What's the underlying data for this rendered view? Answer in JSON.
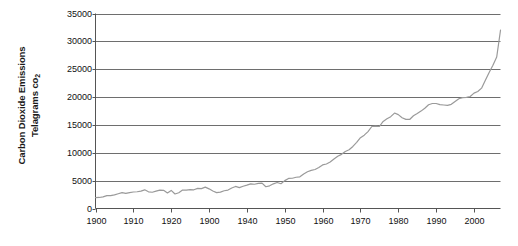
{
  "chart_data": {
    "type": "line",
    "title": "",
    "xlabel": "",
    "ylabel": "Carbon Dioxide Emissions Telagrams co2",
    "ylabel_line1": "Carbon Dioxide Emissions",
    "ylabel_line2_prefix": "Telagrams co",
    "ylabel_line2_subscript": "2",
    "xlim": [
      1900,
      2007
    ],
    "ylim": [
      0,
      35000
    ],
    "y_ticks": [
      0,
      5000,
      10000,
      15000,
      20000,
      25000,
      30000,
      35000
    ],
    "y_tick_labels": [
      "0",
      "5000",
      "10000",
      "15000",
      "20000",
      "25000",
      "30000",
      "35000"
    ],
    "x_ticks": [
      1900,
      1910,
      1920,
      1930,
      1940,
      1950,
      1960,
      1970,
      1980,
      1990,
      2000
    ],
    "x_tick_labels": [
      "1900",
      "1910",
      "1920",
      "1900",
      "1940",
      "1950",
      "1960",
      "1970",
      "1980",
      "1990",
      "2000"
    ],
    "grid": "horizontal",
    "legend": "none",
    "series_color": "#9a9a9a",
    "axis_color": "#555555",
    "grid_color": "#6e6e6e",
    "background": "#ffffff",
    "series": [
      {
        "name": "Carbon Dioxide Emissions",
        "x": [
          1900,
          1901,
          1902,
          1903,
          1904,
          1905,
          1906,
          1907,
          1908,
          1909,
          1910,
          1911,
          1912,
          1913,
          1914,
          1915,
          1916,
          1917,
          1918,
          1919,
          1920,
          1921,
          1922,
          1923,
          1924,
          1925,
          1926,
          1927,
          1928,
          1929,
          1930,
          1931,
          1932,
          1933,
          1934,
          1935,
          1936,
          1937,
          1938,
          1939,
          1940,
          1941,
          1942,
          1943,
          1944,
          1945,
          1946,
          1947,
          1948,
          1949,
          1950,
          1951,
          1952,
          1953,
          1954,
          1955,
          1956,
          1957,
          1958,
          1959,
          1960,
          1961,
          1962,
          1963,
          1964,
          1965,
          1966,
          1967,
          1968,
          1969,
          1970,
          1971,
          1972,
          1973,
          1974,
          1975,
          1976,
          1977,
          1978,
          1979,
          1980,
          1981,
          1982,
          1983,
          1984,
          1985,
          1986,
          1987,
          1988,
          1989,
          1990,
          1991,
          1992,
          1993,
          1994,
          1995,
          1996,
          1997,
          1998,
          1999,
          2000,
          2001,
          2002,
          2003,
          2004,
          2005,
          2006,
          2007
        ],
        "values": [
          1960,
          1980,
          2080,
          2300,
          2300,
          2440,
          2650,
          2850,
          2700,
          2840,
          2960,
          3010,
          3130,
          3350,
          3000,
          2920,
          3130,
          3300,
          3260,
          2800,
          3250,
          2600,
          2820,
          3300,
          3300,
          3380,
          3360,
          3600,
          3570,
          3830,
          3530,
          3130,
          2860,
          2940,
          3190,
          3310,
          3680,
          3960,
          3740,
          4000,
          4200,
          4420,
          4350,
          4510,
          4560,
          3900,
          4070,
          4430,
          4670,
          4450,
          5000,
          5390,
          5430,
          5610,
          5680,
          6200,
          6600,
          6850,
          7000,
          7370,
          7820,
          7990,
          8340,
          8890,
          9390,
          9720,
          10230,
          10540,
          11140,
          11880,
          12700,
          13160,
          13800,
          14720,
          14780,
          14720,
          15630,
          16100,
          16480,
          17130,
          16850,
          16300,
          16000,
          15980,
          16650,
          17050,
          17480,
          18000,
          18620,
          18850,
          18850,
          18640,
          18580,
          18500,
          18700,
          19200,
          19700,
          19900,
          19950,
          20100,
          20700,
          21000,
          21600,
          23000,
          24400,
          25700,
          27200,
          32000
        ]
      }
    ]
  }
}
